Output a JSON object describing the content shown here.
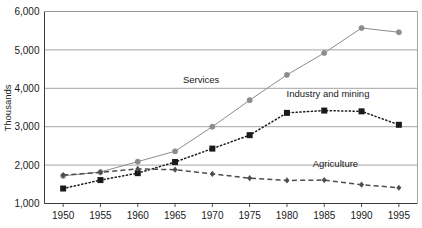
{
  "chart_data": {
    "type": "line",
    "title": "",
    "xlabel": "",
    "ylabel": "Thousands",
    "categories": [
      "1950",
      "1955",
      "1960",
      "1965",
      "1970",
      "1975",
      "1980",
      "1985",
      "1990",
      "1995"
    ],
    "x": [
      1950,
      1955,
      1960,
      1965,
      1970,
      1975,
      1980,
      1985,
      1990,
      1995
    ],
    "xlim": [
      1947.5,
      1997.5
    ],
    "ylim": [
      1000,
      6000
    ],
    "ytick_labels": [
      "1,000",
      "2,000",
      "3,000",
      "4,000",
      "5,000",
      "6,000"
    ],
    "yticks": [
      1000,
      2000,
      3000,
      4000,
      5000,
      6000
    ],
    "grid": "horizontal",
    "legend_position": "inline-annotations",
    "series": [
      {
        "name": "Services",
        "label": "Services",
        "color": "#8c8c8c",
        "marker": "circle",
        "line_style": "solid",
        "values": [
          1720,
          1820,
          2090,
          2360,
          3000,
          3690,
          4350,
          4920,
          5570,
          5460
        ]
      },
      {
        "name": "Industry and mining",
        "label": "Industry and mining",
        "color": "#1a1a1a",
        "marker": "square",
        "line_style": "dotted",
        "values": [
          1390,
          1610,
          1790,
          2080,
          2430,
          2780,
          3360,
          3420,
          3400,
          3050
        ]
      },
      {
        "name": "Agriculture",
        "label": "Agriculture",
        "color": "#4d4d4d",
        "marker": "diamond",
        "line_style": "dashed",
        "values": [
          1740,
          1810,
          1900,
          1880,
          1770,
          1660,
          1600,
          1610,
          1490,
          1410
        ]
      }
    ],
    "annotations": [
      {
        "text": "Services",
        "x": 1968.5,
        "y": 4150
      },
      {
        "text": "Industry and mining",
        "x": 1985.5,
        "y": 3780
      },
      {
        "text": "Agriculture",
        "x": 1986.5,
        "y": 1960
      }
    ]
  }
}
